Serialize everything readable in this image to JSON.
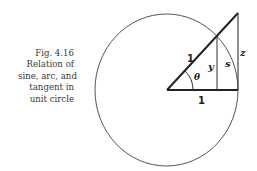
{
  "caption": {
    "lines": [
      "Fig. 4.16",
      "Relation of",
      "sine, arc, and",
      "tangent in",
      "unit circle"
    ]
  },
  "figure": {
    "labels": {
      "radius": "1",
      "base": "1",
      "angle": "θ",
      "sine": "y",
      "arc": "s",
      "tangent": "z"
    },
    "colors": {
      "line": "#222222",
      "circle": "#555555",
      "text": "#3a3a3a"
    }
  }
}
